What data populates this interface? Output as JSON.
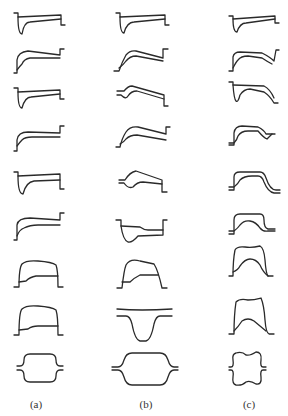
{
  "figure": {
    "columns": [
      {
        "id": "a",
        "label": "(a)",
        "row_count": 9
      },
      {
        "id": "b",
        "label": "(b)",
        "row_count": 9
      },
      {
        "id": "c",
        "label": "(c)",
        "row_count": 9
      }
    ],
    "stroke_color": "#2a2a2a",
    "background": "#ffffff"
  }
}
